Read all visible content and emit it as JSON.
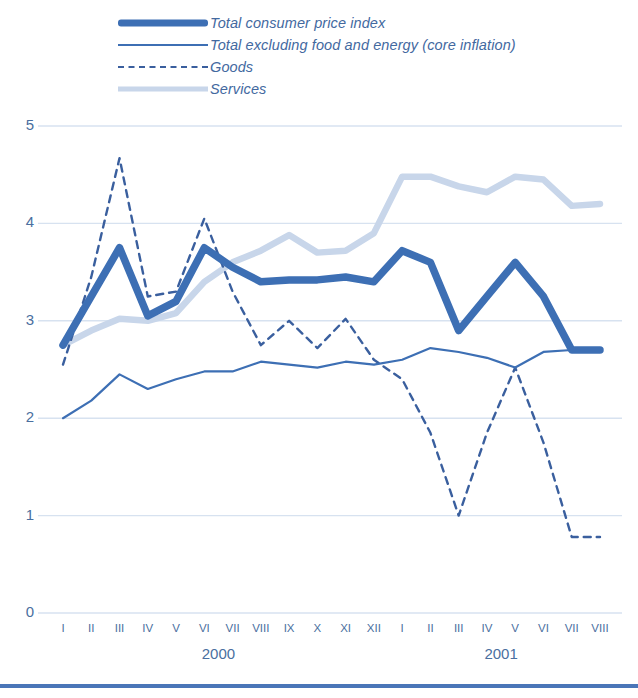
{
  "legend": {
    "items": [
      {
        "key": "cpi",
        "label": "Total consumer price index",
        "swatch": "thick-solid-line-swatch"
      },
      {
        "key": "core",
        "label": "Total excluding food and energy (core inflation)",
        "swatch": "thin-solid-line-swatch"
      },
      {
        "key": "goods",
        "label": "Goods",
        "swatch": "dashed-line-swatch"
      },
      {
        "key": "services",
        "label": "Services",
        "swatch": "thick-light-line-swatch"
      }
    ]
  },
  "colors": {
    "cpi": "#3d6fb4",
    "core": "#3d6fb4",
    "goods": "#3a5f9e",
    "services": "#c8d6ea",
    "grid": "#d7e2f0",
    "text": "#4a6fa0",
    "rule": "#4a76b8"
  },
  "axes": {
    "y_ticks": [
      "0",
      "1",
      "2",
      "3",
      "4",
      "5"
    ],
    "x_ticks": [
      "I",
      "II",
      "III",
      "IV",
      "V",
      "VI",
      "VII",
      "VIII",
      "IX",
      "X",
      "XI",
      "XII",
      "I",
      "II",
      "III",
      "IV",
      "V",
      "VI",
      "VII",
      "VIII"
    ],
    "year_labels": [
      {
        "text": "2000",
        "at_index": 5.5
      },
      {
        "text": "2001",
        "at_index": 15.5
      }
    ]
  },
  "chart_data": {
    "type": "line",
    "title": "",
    "xlabel": "",
    "ylabel": "",
    "ylim": [
      0,
      5
    ],
    "grid": true,
    "legend_position": "top",
    "categories": [
      "2000-I",
      "2000-II",
      "2000-III",
      "2000-IV",
      "2000-V",
      "2000-VI",
      "2000-VII",
      "2000-VIII",
      "2000-IX",
      "2000-X",
      "2000-XI",
      "2000-XII",
      "2001-I",
      "2001-II",
      "2001-III",
      "2001-IV",
      "2001-V",
      "2001-VI",
      "2001-VII",
      "2001-VIII"
    ],
    "series": [
      {
        "name": "Total consumer price index",
        "values": [
          2.75,
          3.25,
          3.75,
          3.05,
          3.2,
          3.75,
          3.55,
          3.4,
          3.42,
          3.42,
          3.45,
          3.4,
          3.72,
          3.6,
          2.9,
          3.25,
          3.6,
          3.25,
          2.7,
          2.7
        ]
      },
      {
        "name": "Total excluding food and energy (core inflation)",
        "values": [
          2.0,
          2.18,
          2.45,
          2.3,
          2.4,
          2.48,
          2.48,
          2.58,
          2.55,
          2.52,
          2.58,
          2.55,
          2.6,
          2.72,
          2.68,
          2.62,
          2.52,
          2.68,
          2.7,
          2.68
        ]
      },
      {
        "name": "Goods",
        "values": [
          2.55,
          3.45,
          4.67,
          3.25,
          3.3,
          4.05,
          3.3,
          2.75,
          3.0,
          2.72,
          3.02,
          2.6,
          2.4,
          1.85,
          1.0,
          1.85,
          2.52,
          1.75,
          0.78,
          0.78
        ]
      },
      {
        "name": "Services",
        "values": [
          2.75,
          2.9,
          3.02,
          3.0,
          3.08,
          3.4,
          3.6,
          3.72,
          3.88,
          3.7,
          3.72,
          3.9,
          4.48,
          4.48,
          4.38,
          4.32,
          4.48,
          4.45,
          4.18,
          4.2
        ]
      }
    ]
  }
}
